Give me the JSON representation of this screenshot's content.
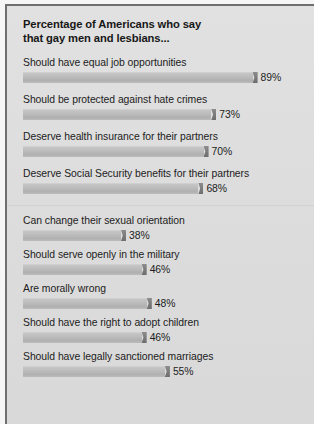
{
  "panel": {
    "title_line1": "Percentage of Americans who say",
    "title_line2": "that gay men and lesbians..."
  },
  "colors": {
    "panel_background": "#dedede",
    "panel_border": "#6f6f6f",
    "bar_fill": "#bdbdbd",
    "bar_cap": "#7b7b7b",
    "text": "#1c1c1c",
    "separator": "#d2d2d2"
  },
  "chart_data": {
    "type": "bar",
    "orientation": "horizontal",
    "xlabel": "",
    "ylabel": "",
    "xlim": [
      0,
      100
    ],
    "grid": false,
    "legend": false,
    "unit": "%",
    "categories": [
      "Should have equal job opportunities",
      "Should be protected against hate crimes",
      "Deserve health insurance for their partners",
      "Deserve Social Security benefits for their partners",
      "Can change their sexual orientation",
      "Should serve openly in the military",
      "Are morally wrong",
      "Should have the right to adopt children",
      "Should have legally sanctioned marriages"
    ],
    "values": [
      89,
      73,
      70,
      68,
      38,
      46,
      48,
      46,
      55
    ],
    "value_labels": [
      "89%",
      "73%",
      "70%",
      "68%",
      "38%",
      "46%",
      "48%",
      "46%",
      "55%"
    ],
    "group_break_after_index": 3
  }
}
